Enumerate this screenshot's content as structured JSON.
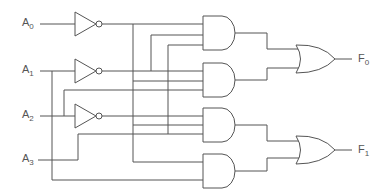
{
  "diagram": {
    "type": "combinational-logic-circuit",
    "inputs": [
      {
        "name": "A",
        "sub": "0"
      },
      {
        "name": "A",
        "sub": "1"
      },
      {
        "name": "A",
        "sub": "2"
      },
      {
        "name": "A",
        "sub": "3"
      }
    ],
    "outputs": [
      {
        "name": "F",
        "sub": "0"
      },
      {
        "name": "F",
        "sub": "1"
      }
    ],
    "gates": {
      "not": 3,
      "and": 4,
      "or": 2
    },
    "colors": {
      "line": "#555555",
      "text": "#555555",
      "background": "#ffffff"
    }
  }
}
